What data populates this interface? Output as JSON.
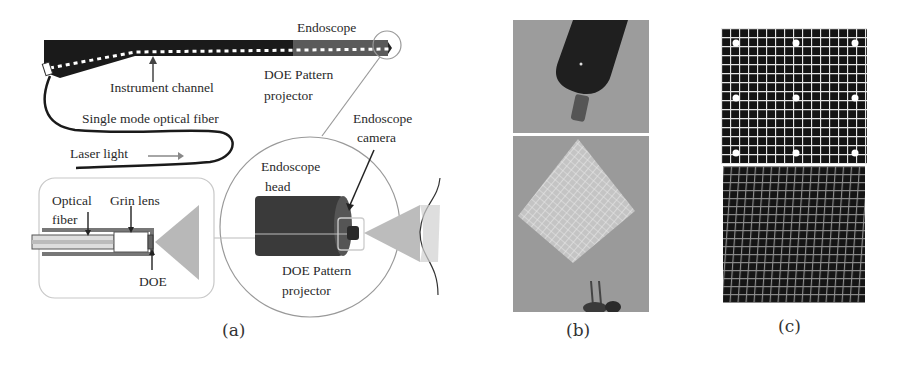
{
  "figure": {
    "panels": [
      {
        "id": "a",
        "caption": "(a)",
        "labels": {
          "endoscope": "Endoscope",
          "instrument_channel": "Instrument channel",
          "doe_pattern_projector_top_line1": "DOE Pattern",
          "doe_pattern_projector_top_line2": "projector",
          "single_mode_fiber": "Single mode optical fiber",
          "laser_light": "Laser light",
          "endoscope_camera_line1": "Endoscope",
          "endoscope_camera_line2": "camera",
          "endoscope_head_line1": "Endoscope",
          "endoscope_head_line2": "head",
          "optical_fiber_line1": "Optical",
          "optical_fiber_line2": "fiber",
          "grin_lens": "Grin lens",
          "doe": "DOE",
          "doe_pattern_projector_bottom_line1": "DOE Pattern",
          "doe_pattern_projector_bottom_line2": "projector"
        }
      },
      {
        "id": "b",
        "caption": "(b)"
      },
      {
        "id": "c",
        "caption": "(c)"
      }
    ],
    "colors": {
      "endoscope_body": "#1a1a1a",
      "endoscope_tip": "#555555",
      "projection_cone": "#b5b5b5",
      "inset_border": "#c8c8c8",
      "photo_background": "#9a9a9a",
      "grid_background": "#141414",
      "grid_lines": "#e6e6e6"
    }
  }
}
